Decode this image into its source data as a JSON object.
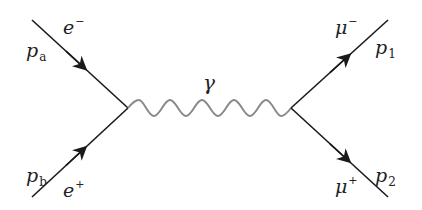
{
  "diagram": {
    "type": "feynman",
    "process": "e- e+ -> gamma -> mu- mu+",
    "colors": {
      "fermion_line": "#1a1a1a",
      "photon_line": "#8a8a8a",
      "label": "#222222",
      "background": "#ffffff"
    },
    "vertices": [
      {
        "id": "v1",
        "x": 128,
        "y": 108
      },
      {
        "id": "v2",
        "x": 291,
        "y": 108
      }
    ],
    "lines": [
      {
        "id": "incoming-electron",
        "kind": "fermion",
        "from": [
          32,
          20
        ],
        "to": [
          128,
          108
        ],
        "arrow": "toward-vertex"
      },
      {
        "id": "incoming-positron",
        "kind": "fermion",
        "from": [
          32,
          197
        ],
        "to": [
          128,
          108
        ],
        "arrow": "toward-vertex"
      },
      {
        "id": "photon",
        "kind": "photon",
        "from": [
          128,
          108
        ],
        "to": [
          291,
          108
        ],
        "periods": 4
      },
      {
        "id": "outgoing-muon",
        "kind": "fermion",
        "from": [
          291,
          108
        ],
        "to": [
          388,
          20
        ],
        "arrow": "away-from-vertex"
      },
      {
        "id": "outgoing-antimuon",
        "kind": "fermion",
        "from": [
          291,
          108
        ],
        "to": [
          388,
          197
        ],
        "arrow": "away-from-vertex"
      }
    ],
    "labels": {
      "pa": {
        "base": "p",
        "sub": "a"
      },
      "pb": {
        "base": "p",
        "sub": "b"
      },
      "e_minus": {
        "base": "e",
        "sup": "−"
      },
      "e_plus": {
        "base": "e",
        "sup": "+"
      },
      "gamma": {
        "base": "γ"
      },
      "mu_minus": {
        "base": "μ",
        "sup": "−"
      },
      "mu_plus": {
        "base": "μ",
        "sup": "+"
      },
      "p1": {
        "base": "p",
        "sub": "1"
      },
      "p2": {
        "base": "p",
        "sub": "2"
      }
    }
  }
}
